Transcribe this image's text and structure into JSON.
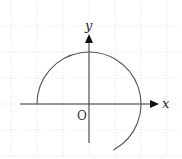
{
  "figure": {
    "type": "coordinate-plane-arc",
    "width": 182,
    "height": 159,
    "background": "#ffffff"
  },
  "grid": {
    "spacing": 26,
    "color": "#d9d9d9",
    "dash": "1,2",
    "x_lines": [
      11,
      37,
      63,
      89,
      115,
      141,
      167
    ],
    "y_lines": [
      26,
      52,
      78,
      104,
      130,
      156
    ]
  },
  "axes": {
    "color": "#333333",
    "origin": {
      "x": 89,
      "y": 104
    },
    "x_axis": {
      "from": 20,
      "to": 159,
      "label": "x"
    },
    "y_axis": {
      "from": 143,
      "to": 34,
      "label": "y"
    },
    "origin_label": "O"
  },
  "arc": {
    "color": "#555555",
    "center": {
      "x": 89,
      "y": 104
    },
    "radius": 52,
    "start_angle_deg": 180,
    "end_angle_deg": -62,
    "direction": "clockwise",
    "start_point": {
      "x": 37,
      "y": 104
    },
    "end_point": {
      "x": 113,
      "y": 150
    }
  }
}
